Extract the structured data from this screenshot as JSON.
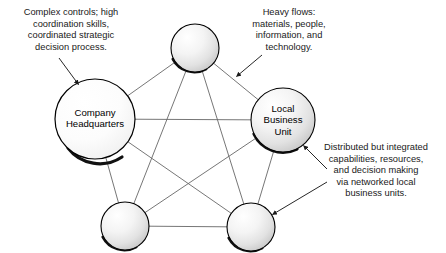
{
  "diagram": {
    "background_color": "#ffffff",
    "edge_color": "#666666",
    "node_outline_color": "#000000",
    "node_fill_light": "#ffffff",
    "node_fill_mid": "#e8e8e8",
    "node_fill_dark": "#b9b9b9",
    "arrow_color": "#1a1a1a",
    "nodes": [
      {
        "id": "company-headquarters",
        "label": "Company\nHeadquarters",
        "cx": 95,
        "cy": 119,
        "r": 40,
        "labeled": true
      },
      {
        "id": "top-unit",
        "label": "",
        "cx": 195,
        "cy": 48,
        "r": 24,
        "labeled": false
      },
      {
        "id": "local-business-unit",
        "label": "Local\nBusiness\nUnit",
        "cx": 283,
        "cy": 120,
        "r": 32,
        "labeled": true
      },
      {
        "id": "bottom-left-unit",
        "label": "",
        "cx": 125,
        "cy": 226,
        "r": 24,
        "labeled": false
      },
      {
        "id": "bottom-right-unit",
        "label": "",
        "cx": 251,
        "cy": 227,
        "r": 24,
        "labeled": false
      }
    ],
    "edges": [
      [
        "company-headquarters",
        "top-unit"
      ],
      [
        "company-headquarters",
        "local-business-unit"
      ],
      [
        "company-headquarters",
        "bottom-left-unit"
      ],
      [
        "company-headquarters",
        "bottom-right-unit"
      ],
      [
        "top-unit",
        "local-business-unit"
      ],
      [
        "top-unit",
        "bottom-left-unit"
      ],
      [
        "top-unit",
        "bottom-right-unit"
      ],
      [
        "local-business-unit",
        "bottom-left-unit"
      ],
      [
        "local-business-unit",
        "bottom-right-unit"
      ],
      [
        "bottom-left-unit",
        "bottom-right-unit"
      ]
    ],
    "annotations": [
      {
        "id": "complex-controls",
        "text": "Complex controls; high\ncoordination skills,\ncoordinated strategic\ndecision process.",
        "points_to": "company-headquarters"
      },
      {
        "id": "heavy-flows",
        "text": "Heavy flows:\nmaterials, people,\ninformation, and\ntechnology.",
        "points_to": "top-unit-to-local-business-unit-edge"
      },
      {
        "id": "distributed-capabilities",
        "text": "Distributed but integrated\ncapabilities, resources,\nand decision making\nvia networked local\nbusiness units.",
        "points_to": "local-business-unit-and-bottom-right-unit"
      }
    ]
  }
}
